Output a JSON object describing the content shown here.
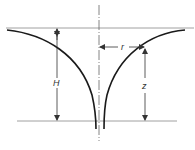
{
  "diagram": {
    "labels": {
      "height_total": "H",
      "radius": "r",
      "depth": "z"
    },
    "colors": {
      "curve": "#1a1a1a",
      "guide": "#888888",
      "dim": "#333333",
      "background": "#ffffff"
    }
  }
}
